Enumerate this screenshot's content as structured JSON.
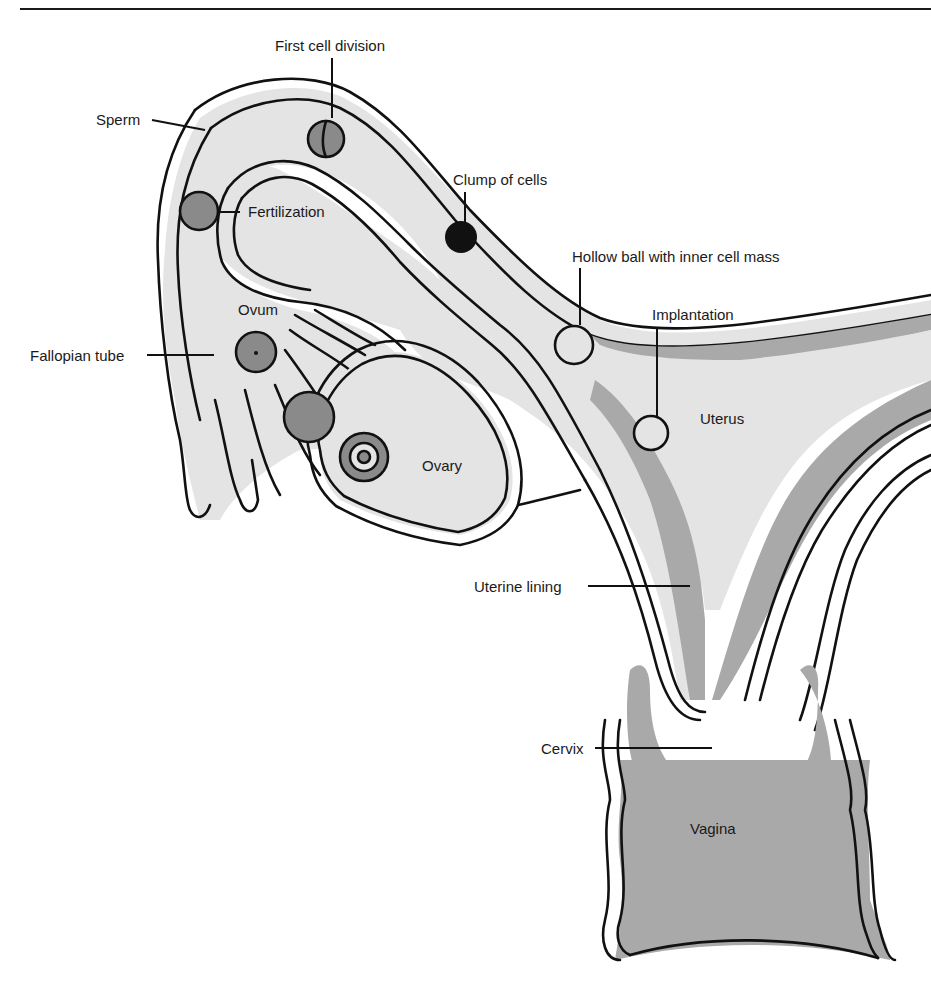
{
  "figure": {
    "type": "anatomical diagram",
    "colors": {
      "outline": "#111111",
      "tube_fill": "#e4e4e4",
      "lining_fill": "#a9a9a9",
      "cell_fill": "#8a8a8a",
      "background": "#ffffff"
    }
  },
  "labels": {
    "first_cell_division": "First cell division",
    "sperm": "Sperm",
    "fertilization": "Fertilization",
    "clump_of_cells": "Clump of cells",
    "hollow_ball": "Hollow ball with inner cell mass",
    "implantation": "Implantation",
    "ovum": "Ovum",
    "fallopian_tube": "Fallopian tube",
    "uterus": "Uterus",
    "ovary": "Ovary",
    "uterine_lining": "Uterine lining",
    "cervix": "Cervix",
    "vagina": "Vagina"
  }
}
